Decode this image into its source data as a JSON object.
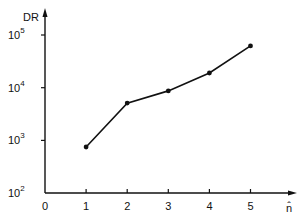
{
  "chart_data": {
    "type": "line",
    "title": "",
    "xlabel": "n̂",
    "ylabel": "DR",
    "yscale": "log",
    "x": [
      1,
      2,
      3,
      4,
      5
    ],
    "series": [
      {
        "name": "DR",
        "values": [
          750,
          5100,
          8700,
          19000,
          62000
        ],
        "markers": true
      }
    ],
    "xticks": [
      "0",
      "1",
      "2",
      "3",
      "4",
      "5"
    ],
    "yticks": [
      {
        "base": "10",
        "exp": "2",
        "value": 100
      },
      {
        "base": "10",
        "exp": "3",
        "value": 1000
      },
      {
        "base": "10",
        "exp": "4",
        "value": 10000
      },
      {
        "base": "10",
        "exp": "5",
        "value": 100000
      }
    ],
    "xlim": [
      0,
      6
    ],
    "ylim": [
      100,
      200000
    ],
    "grid": false,
    "legend": null
  },
  "colors": {
    "line": "#111111",
    "background": "#ffffff"
  }
}
